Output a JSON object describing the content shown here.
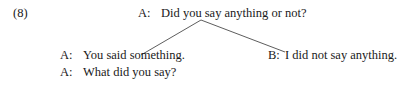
{
  "example": {
    "number": "(8)",
    "root": {
      "speaker": "A:",
      "text": "Did you say anything or not?"
    },
    "left_branch": [
      {
        "speaker": "A:",
        "text": "You said something."
      },
      {
        "speaker": "A:",
        "text": "What did you say?"
      }
    ],
    "right_branch": [
      {
        "speaker": "B:",
        "text": "I did not say anything."
      }
    ]
  }
}
